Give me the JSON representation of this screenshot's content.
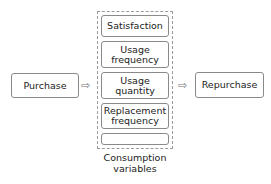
{
  "diagram": {
    "start": "Purchase",
    "end": "Repurchase",
    "variables": [
      "Satisfaction",
      "Usage\nfrequency",
      "Usage\nquantity",
      "Replacement\nfrequency",
      "Availability"
    ],
    "group_caption": "Consumption\nvariables",
    "arrow_glyph": "⇨"
  }
}
